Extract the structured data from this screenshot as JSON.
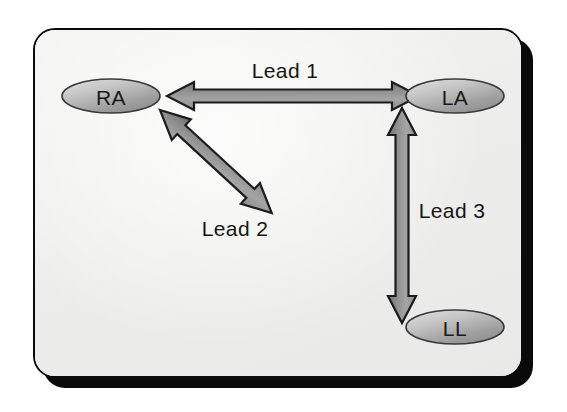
{
  "figure": {
    "frame": {
      "background_color": "#f0f0ee",
      "border_color": "#0b0b0b",
      "shadow_color": "#0a0a0a"
    }
  },
  "nodes": [
    {
      "id": "RA",
      "label": "RA",
      "cx": 111,
      "cy": 96,
      "rx": 49,
      "ry": 17,
      "fill_light": "#d8d8d8",
      "fill_dark": "#8e8e8e"
    },
    {
      "id": "LA",
      "label": "LA",
      "cx": 455,
      "cy": 96,
      "rx": 49,
      "ry": 17,
      "fill_light": "#d8d8d8",
      "fill_dark": "#8e8e8e"
    },
    {
      "id": "LL",
      "label": "LL",
      "cx": 455,
      "cy": 327,
      "rx": 49,
      "ry": 17,
      "fill_light": "#d8d8d8",
      "fill_dark": "#8e8e8e"
    }
  ],
  "leads": [
    {
      "id": "lead-1",
      "label": "Lead 1",
      "from": "RA",
      "to": "LA",
      "double_headed": true,
      "label_x": 285,
      "label_y": 70,
      "arrow_color": "#8a8a8a",
      "outline_color": "#1c1c1c"
    },
    {
      "id": "lead-2",
      "label": "Lead 2",
      "from": "RA",
      "to": "LL",
      "double_headed": true,
      "label_x": 235,
      "label_y": 228,
      "arrow_color": "#8a8a8a",
      "outline_color": "#1c1c1c"
    },
    {
      "id": "lead-3",
      "label": "Lead 3",
      "from": "LL",
      "to": "LA",
      "double_headed": true,
      "label_x": 452,
      "label_y": 210,
      "arrow_color": "#8a8a8a",
      "outline_color": "#1c1c1c"
    }
  ]
}
